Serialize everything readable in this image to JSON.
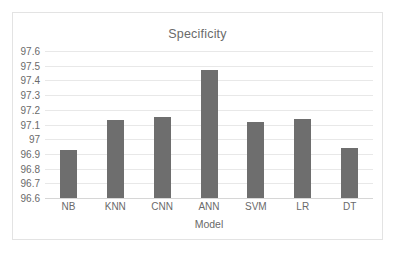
{
  "chart_data": {
    "type": "bar",
    "title": "Specificity",
    "xlabel": "Model",
    "ylabel": "",
    "categories": [
      "NB",
      "KNN",
      "CNN",
      "ANN",
      "SVM",
      "LR",
      "DT"
    ],
    "values": [
      96.93,
      97.13,
      97.15,
      97.47,
      97.12,
      97.14,
      96.94
    ],
    "ylim": [
      96.6,
      97.6
    ],
    "ytick_labels": [
      "97.6",
      "97.5",
      "97.4",
      "97.3",
      "97.2",
      "97.1",
      "97",
      "96.9",
      "96.8",
      "96.7",
      "96.6"
    ],
    "ytick_values": [
      97.6,
      97.5,
      97.4,
      97.3,
      97.2,
      97.1,
      97.0,
      96.9,
      96.8,
      96.7,
      96.6
    ],
    "grid": true,
    "legend": false,
    "bar_color": "#6e6e6e",
    "gridline_color": "#e8e8e8",
    "text_color": "#6a6a6a",
    "background_color": "#ffffff",
    "border_color": "#e3e3e3"
  }
}
